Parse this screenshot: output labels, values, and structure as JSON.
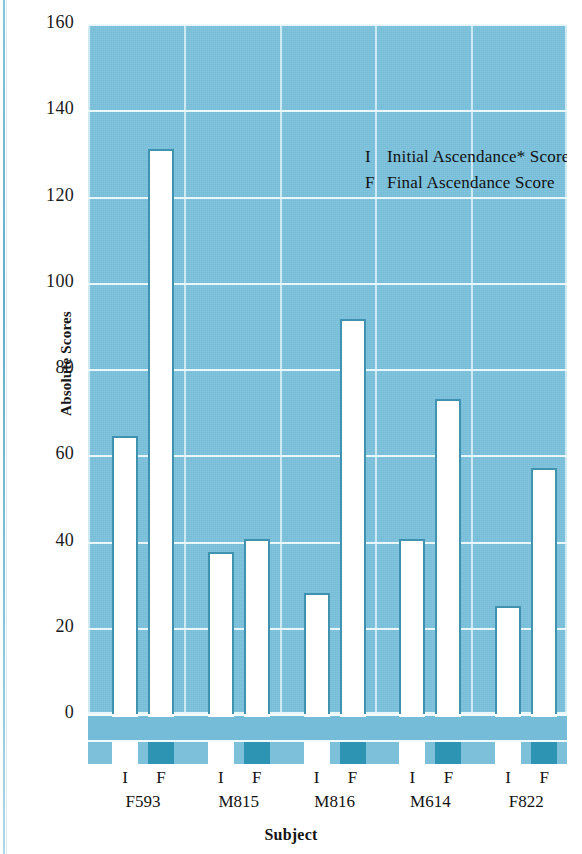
{
  "chart_data": {
    "type": "bar",
    "title": "",
    "xlabel": "Subject",
    "ylabel": "Absolute Scores",
    "ylim": [
      0,
      160
    ],
    "yticks": [
      0,
      20,
      40,
      60,
      80,
      100,
      120,
      140,
      160
    ],
    "grid": true,
    "legend_position": "inside-top-right",
    "categories": [
      "F593",
      "M815",
      "M816",
      "M614",
      "F822"
    ],
    "point_labels": [
      "I",
      "F"
    ],
    "series": [
      {
        "name": "Initial Ascendance* Score",
        "key": "I",
        "values": [
          64.5,
          37.5,
          28,
          40.5,
          25
        ]
      },
      {
        "name": "Final Ascendance Score",
        "key": "F",
        "values": [
          131,
          40.5,
          91.5,
          73,
          57
        ]
      }
    ],
    "legend": [
      {
        "key": "I",
        "label": "Initial Ascendance* Score"
      },
      {
        "key": "F",
        "label": "Final Ascendance Score"
      }
    ],
    "colors": {
      "plot_background": "#74bcd8",
      "bar_fill": "#ffffff",
      "bar_outline": "#3f93b0",
      "gridline": "#f3fbfd",
      "final_marker": "#2e94b4",
      "text": "#121212"
    }
  },
  "axes": {
    "y_title": "Absolute Scores",
    "x_title": "Subject",
    "y_tick_labels": [
      "160",
      "140",
      "120",
      "100",
      "80",
      "60",
      "40",
      "20",
      "0"
    ]
  },
  "legend": {
    "rows": [
      {
        "key": "I",
        "text": "Initial Ascendance* Score"
      },
      {
        "key": "F",
        "text": "Final Ascendance Score"
      }
    ]
  },
  "groups": [
    {
      "name": "F593",
      "i_label": "I",
      "f_label": "F"
    },
    {
      "name": "M815",
      "i_label": "I",
      "f_label": "F"
    },
    {
      "name": "M816",
      "i_label": "I",
      "f_label": "F"
    },
    {
      "name": "M614",
      "i_label": "I",
      "f_label": "F"
    },
    {
      "name": "F822",
      "i_label": "I",
      "f_label": "F"
    }
  ]
}
